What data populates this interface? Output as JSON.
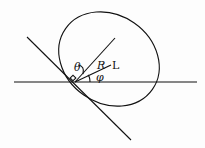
{
  "diagram": {
    "labels": {
      "theta": "θ",
      "R": "R",
      "L": "L",
      "phi": "φ"
    },
    "colors": {
      "stroke": "#111111",
      "background": "#fdfdfd"
    }
  }
}
